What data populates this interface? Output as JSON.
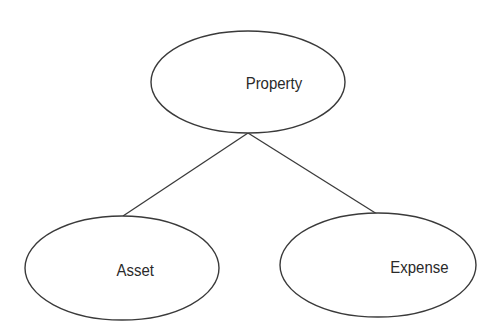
{
  "diagram": {
    "type": "hierarchy",
    "nodes": [
      {
        "id": "property",
        "label": "Property",
        "shape": "ellipse"
      },
      {
        "id": "asset",
        "label": "Asset",
        "shape": "ellipse"
      },
      {
        "id": "expense",
        "label": "Expense",
        "shape": "ellipse"
      }
    ],
    "edges": [
      {
        "from": "property",
        "to": "asset"
      },
      {
        "from": "property",
        "to": "expense"
      }
    ]
  }
}
